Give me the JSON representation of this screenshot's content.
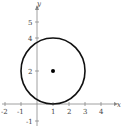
{
  "figure": {
    "type": "circle-graph",
    "x_axis_label": "x",
    "y_axis_label": "y",
    "x_ticks": [
      {
        "value": -2,
        "label": "-2"
      },
      {
        "value": -1,
        "label": "-1"
      },
      {
        "value": 1,
        "label": "1"
      },
      {
        "value": 2,
        "label": "2"
      },
      {
        "value": 3,
        "label": "3"
      },
      {
        "value": 4,
        "label": "4"
      }
    ],
    "y_ticks": [
      {
        "value": -1,
        "label": "-1"
      },
      {
        "value": 2,
        "label": "2"
      },
      {
        "value": 4,
        "label": "4"
      },
      {
        "value": 5,
        "label": "5"
      }
    ],
    "circle": {
      "center": [
        1,
        2
      ],
      "radius": 2
    },
    "center_point": [
      1,
      2
    ],
    "colors": {
      "axis": "#888888",
      "curve": "#111111",
      "point": "#000000"
    }
  }
}
